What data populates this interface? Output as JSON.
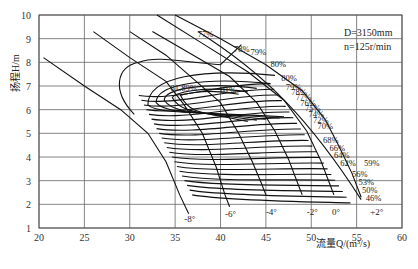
{
  "chart_data": {
    "type": "line",
    "title": "",
    "xlabel": "流量Q/(m³/s)",
    "ylabel": "扬程H/m",
    "xlim": [
      20,
      60
    ],
    "ylim": [
      1,
      10
    ],
    "xticks": [
      20,
      25,
      30,
      35,
      40,
      45,
      50,
      55,
      60
    ],
    "yticks": [
      1,
      2,
      3,
      4,
      5,
      6,
      7,
      8,
      9,
      10
    ],
    "grid": true,
    "annotation": {
      "D": "D=3150mm",
      "n": "n=125r/min"
    },
    "blade_angle_series": [
      {
        "name": "-8°",
        "points": [
          [
            20.5,
            8.2
          ],
          [
            25,
            7.0
          ],
          [
            29,
            6.0
          ],
          [
            32,
            5.0
          ],
          [
            34,
            3.8
          ],
          [
            35.5,
            2.4
          ],
          [
            36.5,
            1.6
          ]
        ]
      },
      {
        "name": "-6°",
        "points": [
          [
            26,
            9.3
          ],
          [
            30,
            8.2
          ],
          [
            34,
            7.2
          ],
          [
            36,
            6.2
          ],
          [
            38,
            5.0
          ],
          [
            39.5,
            3.6
          ],
          [
            40.5,
            2.4
          ],
          [
            41,
            1.9
          ]
        ]
      },
      {
        "name": "-4°",
        "points": [
          [
            30,
            9.3
          ],
          [
            34,
            8.3
          ],
          [
            37,
            7.3
          ],
          [
            40,
            6.3
          ],
          [
            42,
            5.0
          ],
          [
            43.5,
            3.8
          ],
          [
            44.5,
            2.9
          ],
          [
            45,
            2.4
          ]
        ]
      },
      {
        "name": "-2°",
        "points": [
          [
            32.5,
            9.3
          ],
          [
            37,
            8.3
          ],
          [
            41,
            7.4
          ],
          [
            44,
            6.3
          ],
          [
            46,
            5.1
          ],
          [
            47.5,
            3.9
          ],
          [
            48.5,
            2.9
          ],
          [
            49,
            2.4
          ]
        ]
      },
      {
        "name": "0°",
        "points": [
          [
            33,
            10.0
          ],
          [
            38,
            8.8
          ],
          [
            43,
            7.6
          ],
          [
            47,
            6.4
          ],
          [
            49.5,
            5.1
          ],
          [
            51,
            3.9
          ],
          [
            52,
            2.9
          ],
          [
            52.5,
            2.4
          ]
        ]
      },
      {
        "name": "+2°",
        "points": [
          [
            35,
            10.0
          ],
          [
            40,
            9.0
          ],
          [
            45,
            7.9
          ],
          [
            49,
            6.8
          ],
          [
            51.5,
            5.6
          ],
          [
            53,
            4.5
          ],
          [
            54.5,
            3.3
          ],
          [
            55.5,
            2.3
          ]
        ]
      }
    ],
    "efficiency_contours": [
      "77%",
      "78%",
      "79%",
      "80%",
      "80%",
      "81.89%",
      "81%",
      "79%",
      "78%",
      "77%",
      "76%",
      "75%",
      "74%",
      "72%",
      "70%",
      "68%",
      "66%",
      "64%",
      "62%",
      "59%",
      "56%",
      "53%",
      "50%",
      "46%"
    ],
    "angle_labels": [
      "-8°",
      "-6°",
      "-4°",
      "-2°",
      "0°",
      "+2°"
    ]
  },
  "labels": {
    "xlabel": "流量Q/(m³/s)",
    "ylabel": "扬程H/m",
    "D": "D=3150mm",
    "n": "n=125r/min"
  }
}
